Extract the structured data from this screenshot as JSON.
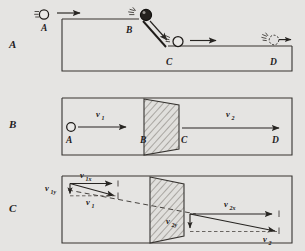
{
  "figure": {
    "background_color": "#f2f1ef",
    "ink_color": "#2a2724",
    "panel_count": 3
  },
  "panels": [
    {
      "id": "panel-a",
      "label": "A",
      "caption": "Ball rolling down an incline between two levels",
      "points": [
        {
          "label": "A",
          "role": "upper-level-start"
        },
        {
          "label": "B",
          "role": "top-of-incline"
        },
        {
          "label": "C",
          "role": "bottom-of-incline"
        },
        {
          "label": "D",
          "role": "lower-level-end"
        }
      ],
      "balls": [
        {
          "at": "A",
          "style": "open",
          "motion_lines": true
        },
        {
          "at": "B",
          "style": "filled",
          "motion_lines": true
        },
        {
          "at": "incline",
          "style": "open",
          "motion_lines": true
        },
        {
          "at": "D",
          "style": "dotted",
          "motion_lines": true
        }
      ],
      "arrows": [
        {
          "name": "arrow-upper-level",
          "direction": "right"
        },
        {
          "name": "arrow-along-incline",
          "direction": "down-right"
        },
        {
          "name": "arrow-lower-level",
          "direction": "right"
        },
        {
          "name": "arrow-at-d",
          "direction": "right"
        }
      ]
    },
    {
      "id": "panel-b",
      "label": "B",
      "caption": "Normal incidence: speed changes across the boundary region",
      "points": [
        {
          "label": "A",
          "role": "incoming-ball"
        },
        {
          "label": "B",
          "role": "boundary-near"
        },
        {
          "label": "C",
          "role": "boundary-far"
        },
        {
          "label": "D",
          "role": "outgoing-end"
        }
      ],
      "vectors": [
        {
          "name": "v1",
          "base": "v",
          "sub": "1",
          "region": "before-boundary"
        },
        {
          "name": "v2",
          "base": "v",
          "sub": "2",
          "region": "after-boundary"
        }
      ],
      "region": {
        "name": "transition-region",
        "fill": "diagonal-hatch"
      }
    },
    {
      "id": "panel-c",
      "label": "C",
      "caption": "Oblique incidence: x component unchanged, y component increases",
      "vectors": [
        {
          "name": "v1x",
          "base": "v",
          "sub": "1x",
          "region": "before-boundary"
        },
        {
          "name": "v1y",
          "base": "v",
          "sub": "1y",
          "region": "before-boundary"
        },
        {
          "name": "v1",
          "base": "v",
          "sub": "1",
          "region": "before-boundary"
        },
        {
          "name": "v2x",
          "base": "v",
          "sub": "2x",
          "region": "after-boundary"
        },
        {
          "name": "v2y",
          "base": "v",
          "sub": "2y",
          "region": "after-boundary"
        },
        {
          "name": "v2",
          "base": "v",
          "sub": "2",
          "region": "after-boundary"
        }
      ],
      "region": {
        "name": "transition-region",
        "fill": "diagonal-hatch"
      },
      "construction_line": {
        "name": "incident-extension",
        "style": "dashed"
      }
    }
  ]
}
